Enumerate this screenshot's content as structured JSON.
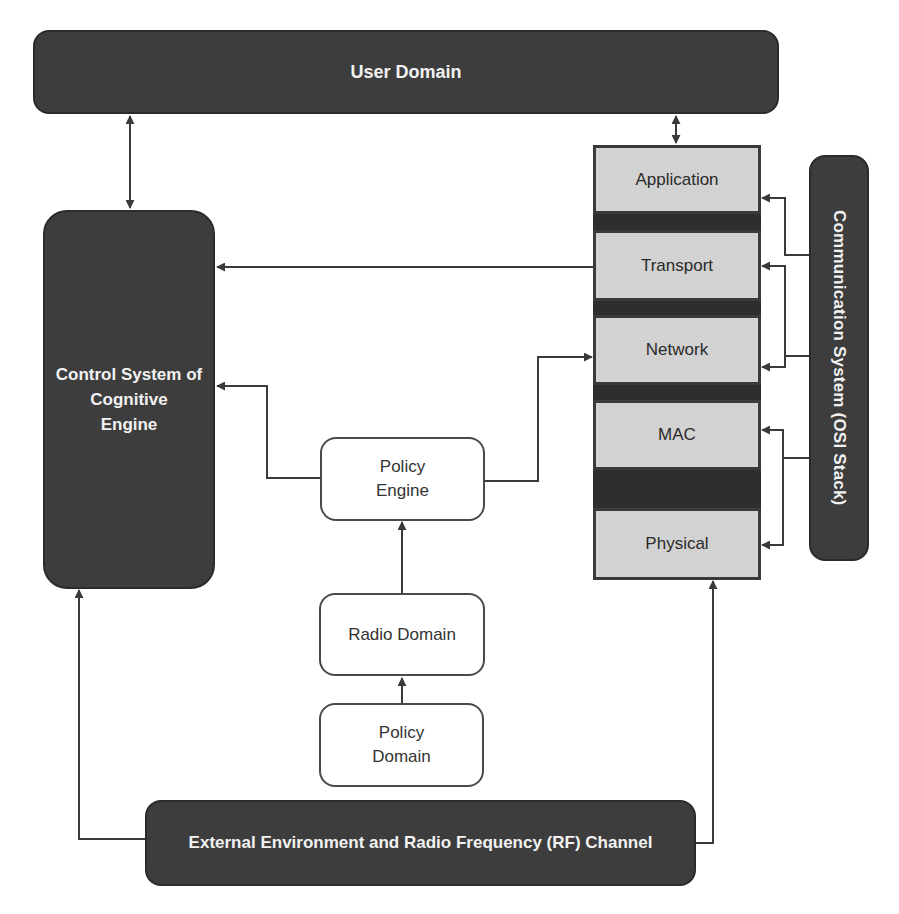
{
  "diagram": {
    "user_domain": {
      "label": "User Domain"
    },
    "control_system": {
      "label_lines": [
        "Control System of",
        "Cognitive",
        "Engine"
      ]
    },
    "osi_stack": {
      "layers": [
        {
          "label": "Application"
        },
        {
          "label": "Transport"
        },
        {
          "label": "Network"
        },
        {
          "label": "MAC"
        },
        {
          "label": "Physical"
        }
      ]
    },
    "communication_system": {
      "label": "Communication System (OSI Stack)"
    },
    "policy_engine": {
      "label_lines": [
        "Policy",
        "Engine"
      ]
    },
    "radio_domain": {
      "label": "Radio Domain"
    },
    "policy_domain": {
      "label_lines": [
        "Policy",
        "Domain"
      ]
    },
    "external_environment": {
      "label": "External Environment and Radio Frequency (RF) Channel"
    },
    "connections": [
      {
        "from": "User Domain",
        "to": "Control System of Cognitive Engine",
        "type": "bidirectional"
      },
      {
        "from": "User Domain",
        "to": "Application",
        "type": "bidirectional"
      },
      {
        "from": "Transport",
        "to": "Control System of Cognitive Engine",
        "type": "arrow"
      },
      {
        "from": "Policy Engine",
        "to": "Control System of Cognitive Engine",
        "type": "arrow"
      },
      {
        "from": "Policy Engine",
        "to": "Network",
        "type": "arrow"
      },
      {
        "from": "Radio Domain",
        "to": "Policy Engine",
        "type": "arrow"
      },
      {
        "from": "Policy Domain",
        "to": "Radio Domain",
        "type": "arrow"
      },
      {
        "from": "External Environment and Radio Frequency (RF) Channel",
        "to": "Control System of Cognitive Engine",
        "type": "arrow"
      },
      {
        "from": "External Environment and Radio Frequency (RF) Channel",
        "to": "Physical",
        "type": "arrow"
      },
      {
        "from": "Communication System (OSI Stack)",
        "to": "Application",
        "type": "arrow"
      },
      {
        "from": "Communication System (OSI Stack)",
        "to": "Transport",
        "type": "arrow"
      },
      {
        "from": "Communication System (OSI Stack)",
        "to": "Network",
        "type": "arrow"
      },
      {
        "from": "Communication System (OSI Stack)",
        "to": "MAC",
        "type": "arrow"
      },
      {
        "from": "Communication System (OSI Stack)",
        "to": "Physical",
        "type": "arrow"
      }
    ]
  },
  "colors": {
    "dark_fill": "#3d3d3d",
    "layer_fill": "#d2d2d2",
    "line": "#3a3a3a",
    "white_text": "#f2f2f2"
  }
}
